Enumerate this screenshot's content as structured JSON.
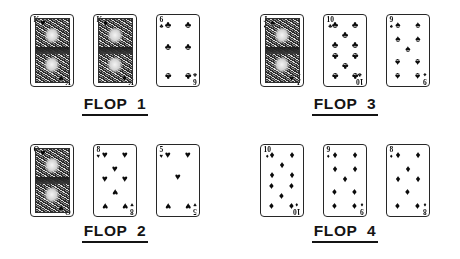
{
  "suit_glyphs": {
    "spade": "♠",
    "heart": "♥",
    "diamond": "♦",
    "club": "♣"
  },
  "flops": [
    {
      "label": "FLOP  1",
      "name": "flop-1",
      "cards": [
        {
          "rank": "K",
          "suit": "heart",
          "suit_name": "hearts",
          "type": "court",
          "pip_count": 0,
          "display": "K♥"
        },
        {
          "rank": "K",
          "suit": "diamond",
          "suit_name": "diamonds",
          "type": "court",
          "pip_count": 0,
          "display": "K♦"
        },
        {
          "rank": "6",
          "suit": "club",
          "suit_name": "clubs",
          "type": "number",
          "pip_count": 6,
          "display": "6♣"
        }
      ]
    },
    {
      "label": "FLOP  3",
      "name": "flop-3",
      "cards": [
        {
          "rank": "J",
          "suit": "spade",
          "suit_name": "spades",
          "type": "court",
          "pip_count": 0,
          "display": "J♠"
        },
        {
          "rank": "10",
          "suit": "club",
          "suit_name": "clubs",
          "type": "number",
          "pip_count": 10,
          "display": "10♣"
        },
        {
          "rank": "9",
          "suit": "spade",
          "suit_name": "spades",
          "type": "number",
          "pip_count": 9,
          "display": "9♠"
        }
      ]
    },
    {
      "label": "FLOP  2",
      "name": "flop-2",
      "cards": [
        {
          "rank": "Q",
          "suit": "heart",
          "suit_name": "hearts",
          "type": "court",
          "pip_count": 0,
          "display": "Q♥"
        },
        {
          "rank": "8",
          "suit": "heart",
          "suit_name": "hearts",
          "type": "number",
          "pip_count": 8,
          "display": "8♥"
        },
        {
          "rank": "5",
          "suit": "heart",
          "suit_name": "hearts",
          "type": "number",
          "pip_count": 5,
          "display": "5♥"
        }
      ]
    },
    {
      "label": "FLOP  4",
      "name": "flop-4",
      "cards": [
        {
          "rank": "10",
          "suit": "diamond",
          "suit_name": "diamonds",
          "type": "number",
          "pip_count": 10,
          "display": "10♦"
        },
        {
          "rank": "9",
          "suit": "diamond",
          "suit_name": "diamonds",
          "type": "number",
          "pip_count": 9,
          "display": "9♦"
        },
        {
          "rank": "8",
          "suit": "diamond",
          "suit_name": "diamonds",
          "type": "number",
          "pip_count": 8,
          "display": "8♦"
        }
      ]
    }
  ]
}
